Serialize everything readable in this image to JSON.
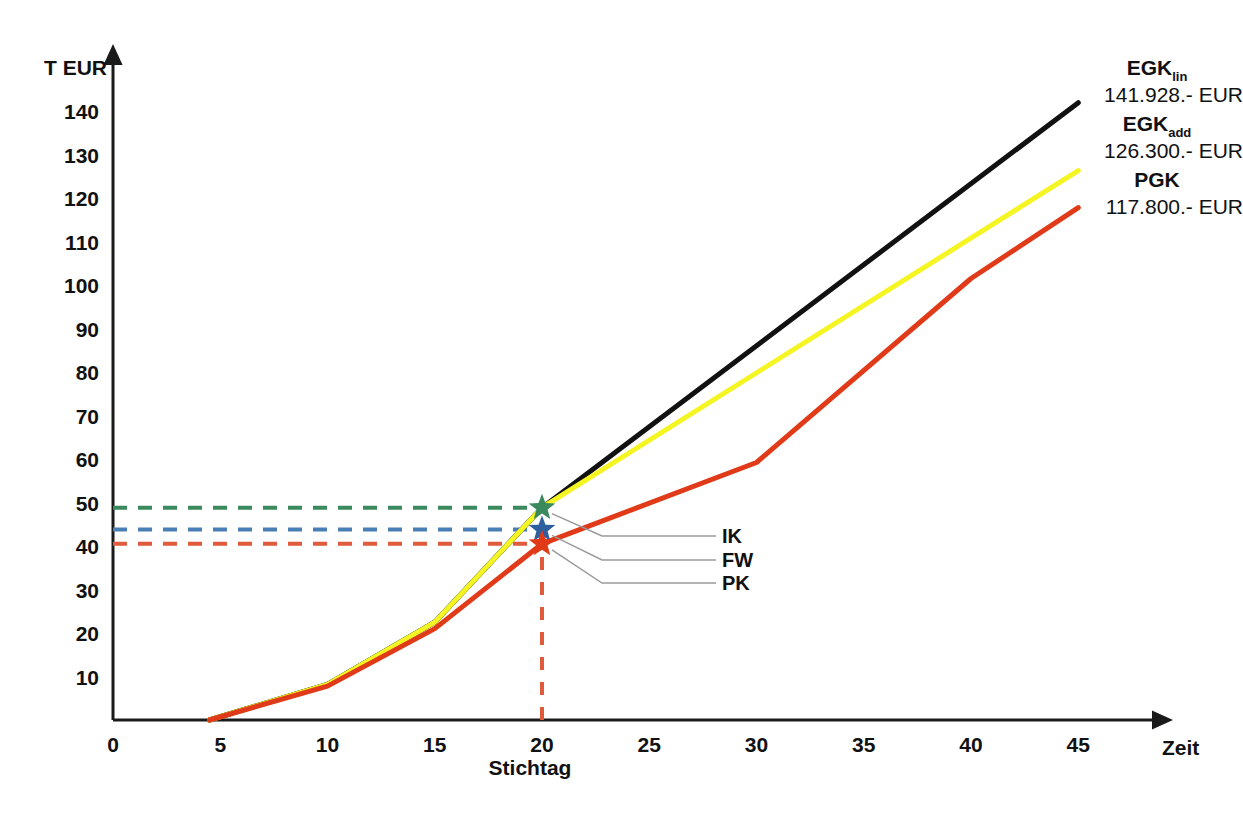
{
  "chart_data": {
    "type": "line",
    "title": "",
    "xlabel": "Zeit",
    "ylabel": "T EUR",
    "xlim": [
      0,
      48
    ],
    "ylim": [
      0,
      145
    ],
    "xticks": [
      "0",
      "5",
      "10",
      "15",
      "20",
      "25",
      "30",
      "35",
      "40",
      "45"
    ],
    "xtick_values": [
      0,
      5,
      10,
      15,
      20,
      25,
      30,
      35,
      40,
      45
    ],
    "yticks": [
      "10",
      "20",
      "30",
      "40",
      "50",
      "60",
      "70",
      "80",
      "90",
      "100",
      "110",
      "120",
      "130",
      "140"
    ],
    "ytick_values": [
      10,
      20,
      30,
      40,
      50,
      60,
      70,
      80,
      90,
      100,
      110,
      120,
      130,
      140
    ],
    "grid": false,
    "legend_position": "right-inline",
    "series": [
      {
        "name": "EGK",
        "name_sub": "lin",
        "value_label": "141.928.- EUR",
        "color": "#111111",
        "x": [
          4.5,
          10,
          15,
          20,
          45
        ],
        "y": [
          0,
          8.2,
          22.5,
          48.8,
          141.9
        ]
      },
      {
        "name": "EGK",
        "name_sub": "add",
        "value_label": "126.300.- EUR",
        "color": "#f5f523",
        "x": [
          4.5,
          10,
          15,
          20,
          45
        ],
        "y": [
          0,
          8.2,
          22.5,
          48.8,
          126.3
        ]
      },
      {
        "name": "PGK",
        "name_sub": "",
        "value_label": "117.800.- EUR",
        "color": "#e03a18",
        "x": [
          4.5,
          10,
          15,
          20,
          30,
          40,
          45
        ],
        "y": [
          0,
          7.8,
          21.0,
          40.5,
          59.2,
          101.5,
          117.8
        ]
      },
      {
        "name": "IK-verlauf",
        "name_sub": "",
        "value_label": "",
        "color": "#3a8a5e",
        "x": [
          4.5,
          10,
          15,
          20
        ],
        "y": [
          0,
          8.2,
          22.5,
          48.8
        ]
      }
    ],
    "markers": [
      {
        "label": "IK",
        "x": 20,
        "y": 48.8,
        "color": "#3a8a5e"
      },
      {
        "label": "FW",
        "x": 20,
        "y": 43.8,
        "color": "#2e5f9e"
      },
      {
        "label": "PK",
        "x": 20,
        "y": 40.5,
        "color": "#e03a18"
      }
    ],
    "reference_lines": [
      {
        "name": "ik-dashed",
        "y": 48.8,
        "color": "#3a8a5e",
        "orientation": "horizontal"
      },
      {
        "name": "fw-dashed",
        "y": 43.8,
        "color": "#4a7fb5",
        "orientation": "horizontal"
      },
      {
        "name": "pk-dashed",
        "y": 40.5,
        "color": "#e05a3c",
        "orientation": "horizontal"
      },
      {
        "name": "stichtag-dashed",
        "x": 20,
        "color": "#e05a3c",
        "orientation": "vertical"
      }
    ],
    "annotations": [
      {
        "name": "stichtag",
        "text": "Stichtag",
        "x": 20
      }
    ]
  }
}
